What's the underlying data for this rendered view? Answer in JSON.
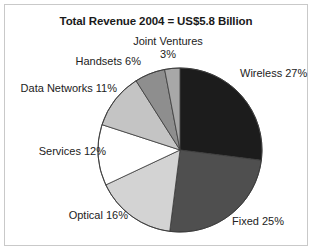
{
  "chart_data": {
    "type": "pie",
    "title": "Total Revenue 2004 = US$5.8 Billion",
    "subtitle": "",
    "xlabel": "",
    "ylabel": "",
    "units": "percent",
    "total_label": "US$5.8 Billion",
    "legend_position": "none",
    "grid": false,
    "labels_outside": true,
    "start_angle_deg": 0,
    "direction": "clockwise",
    "categories": [
      "Wireless",
      "Fixed",
      "Optical",
      "Services",
      "Data Networks",
      "Handsets",
      "Joint Ventures"
    ],
    "values": [
      27,
      25,
      16,
      12,
      11,
      6,
      3
    ],
    "value_suffix": "%",
    "colors": [
      "#1c1c1c",
      "#4f4f4f",
      "#d3d3d3",
      "#ffffff",
      "#c4c4c4",
      "#8e8e8e",
      "#a8a8a8"
    ],
    "slice_edge_color": "#3a3a3a",
    "slices": [
      {
        "name": "Wireless",
        "value": 27,
        "label": "Wireless 27%",
        "color": "#1c1c1c"
      },
      {
        "name": "Fixed",
        "value": 25,
        "label": "Fixed 25%",
        "color": "#4f4f4f"
      },
      {
        "name": "Optical",
        "value": 16,
        "label": "Optical 16%",
        "color": "#d3d3d3"
      },
      {
        "name": "Services",
        "value": 12,
        "label": "Services 12%",
        "color": "#ffffff"
      },
      {
        "name": "Data Networks",
        "value": 11,
        "label": "Data Networks 11%",
        "color": "#c4c4c4"
      },
      {
        "name": "Handsets",
        "value": 6,
        "label": "Handsets 6%",
        "color": "#8e8e8e"
      },
      {
        "name": "Joint Ventures",
        "value": 3,
        "label": "Joint Ventures",
        "color": "#a8a8a8"
      }
    ]
  },
  "labels": {
    "joint_ventures_name": "Joint Ventures",
    "joint_ventures_value": "3%",
    "handsets": "Handsets 6%",
    "data_networks": "Data Networks 11%",
    "services": "Services 12%",
    "optical": "Optical 16%",
    "fixed": "Fixed 25%",
    "wireless": "Wireless 27%"
  },
  "style": {
    "frame_color": "#c9c9c9",
    "background": "#ffffff",
    "text_color": "#222222",
    "title_color": "#1a1a1a"
  }
}
